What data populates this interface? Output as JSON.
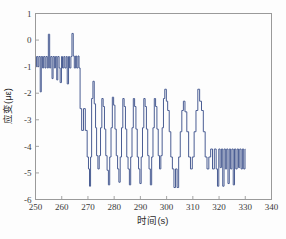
{
  "figure": {
    "name": "strain-vs-time-plot",
    "background": "#fdfdfd",
    "caption_faint": ""
  },
  "chart_data": {
    "type": "line",
    "title": "",
    "xlabel": "时间(s)",
    "ylabel": "应变(με)",
    "xlim": [
      250,
      340
    ],
    "ylim": [
      -6,
      1
    ],
    "xticks": [
      250,
      260,
      270,
      280,
      290,
      300,
      310,
      320,
      330,
      340
    ],
    "xtick_labels": [
      "250",
      "260",
      "270",
      "280",
      "290",
      "300",
      "310",
      "320",
      "330",
      "340"
    ],
    "yticks": [
      1,
      0,
      -1,
      -2,
      -3,
      -4,
      -5,
      -6
    ],
    "ytick_labels": [
      "1",
      "0",
      "-1",
      "-2",
      "-3",
      "-4",
      "-5",
      "-6"
    ],
    "grid": false,
    "legend": null,
    "series": [
      {
        "name": "strain",
        "color": "#4a5d93",
        "linewidth": 1.0,
        "description": "Noisy square-wave strain signal: initial band near -0.8, step down, train of rectangular pulses between -2.2 and -4.6, final band near -4.4",
        "x": [
          250.0,
          250.4,
          250.4,
          250.9,
          250.9,
          251.3,
          251.3,
          251.8,
          251.8,
          252.2,
          252.2,
          252.7,
          252.7,
          253.1,
          253.1,
          253.6,
          253.6,
          254.0,
          254.0,
          254.5,
          254.5,
          254.9,
          254.9,
          255.4,
          255.4,
          255.8,
          255.8,
          256.3,
          256.3,
          256.7,
          256.7,
          257.2,
          257.2,
          257.6,
          257.6,
          258.1,
          258.1,
          258.5,
          258.5,
          259.0,
          259.0,
          259.4,
          259.4,
          259.9,
          259.9,
          260.3,
          260.3,
          260.8,
          260.8,
          261.2,
          261.2,
          261.7,
          261.7,
          262.1,
          262.1,
          262.6,
          262.6,
          263.0,
          263.0,
          263.5,
          263.5,
          263.9,
          263.9,
          264.4,
          264.4,
          264.8,
          264.8,
          265.3,
          265.3,
          265.7,
          265.7,
          266.2,
          266.2,
          266.6,
          266.6,
          267.0,
          267.0,
          267.6,
          267.6,
          268.3,
          268.3,
          269.0,
          269.0,
          269.7,
          269.7,
          270.2,
          270.2,
          270.6,
          270.6,
          271.0,
          271.0,
          271.4,
          271.4,
          271.9,
          271.9,
          272.4,
          272.4,
          272.9,
          272.9,
          273.3,
          273.3,
          273.8,
          273.8,
          274.3,
          274.3,
          274.8,
          274.8,
          275.3,
          275.3,
          275.8,
          275.8,
          276.3,
          276.3,
          276.8,
          276.8,
          277.3,
          277.3,
          277.8,
          277.8,
          278.3,
          278.3,
          278.8,
          278.8,
          279.3,
          279.3,
          279.8,
          279.8,
          280.3,
          280.3,
          280.8,
          280.8,
          281.3,
          281.3,
          281.8,
          281.8,
          282.3,
          282.3,
          282.8,
          282.8,
          283.3,
          283.3,
          283.8,
          283.8,
          284.3,
          284.3,
          284.8,
          284.8,
          285.3,
          285.3,
          285.8,
          285.8,
          286.3,
          286.3,
          286.8,
          286.8,
          287.3,
          287.3,
          287.8,
          287.8,
          288.3,
          288.3,
          288.8,
          288.8,
          289.3,
          289.3,
          289.8,
          289.8,
          290.3,
          290.3,
          290.8,
          290.8,
          291.3,
          291.3,
          291.8,
          291.8,
          292.3,
          292.3,
          292.8,
          292.8,
          293.3,
          293.3,
          293.8,
          293.8,
          294.3,
          294.3,
          294.8,
          294.8,
          295.3,
          295.3,
          295.8,
          295.8,
          296.3,
          296.3,
          296.8,
          296.8,
          297.3,
          297.3,
          297.8,
          297.8,
          298.3,
          298.3,
          298.8,
          298.8,
          299.3,
          299.3,
          299.9,
          299.9,
          300.4,
          300.4,
          301.0,
          301.0,
          301.6,
          301.6,
          302.2,
          302.2,
          302.8,
          302.8,
          303.4,
          303.4,
          304.0,
          304.0,
          304.6,
          304.6,
          305.2,
          305.2,
          305.8,
          305.8,
          306.4,
          306.4,
          307.0,
          307.0,
          307.7,
          307.7,
          308.4,
          308.4,
          309.1,
          309.1,
          309.8,
          309.8,
          310.5,
          310.5,
          311.2,
          311.2,
          311.9,
          311.9,
          312.6,
          312.6,
          313.3,
          313.3,
          314.0,
          314.0,
          314.7,
          314.7,
          315.4,
          315.4,
          316.1,
          316.1,
          316.8,
          316.8,
          317.5,
          317.5,
          318.2,
          318.2,
          318.9,
          318.9,
          319.4,
          319.4,
          319.9,
          319.9,
          320.4,
          320.4,
          320.9,
          320.9,
          321.4,
          321.4,
          321.9,
          321.9,
          322.4,
          322.4,
          322.9,
          322.9,
          323.4,
          323.4,
          323.9,
          323.9,
          324.4,
          324.4,
          324.9,
          324.9,
          325.4,
          325.4,
          325.9,
          325.9,
          326.4,
          326.4,
          326.9,
          326.9,
          327.4,
          327.4,
          327.9,
          327.9,
          328.4,
          328.4,
          328.9,
          328.9,
          329.4,
          329.4,
          329.9,
          329.9,
          330.0
        ],
        "y": [
          -1.0,
          -1.0,
          -0.62,
          -0.62,
          -1.0,
          -1.0,
          -0.62,
          -0.62,
          -1.95,
          -1.95,
          -0.62,
          -0.62,
          -1.05,
          -1.05,
          -0.62,
          -0.62,
          -1.05,
          -1.05,
          -0.62,
          -0.62,
          -1.05,
          -1.05,
          0.22,
          0.22,
          -1.05,
          -1.05,
          -0.62,
          -0.62,
          -1.45,
          -1.45,
          -0.62,
          -0.62,
          -1.05,
          -1.05,
          -0.62,
          -0.62,
          -1.5,
          -1.5,
          -0.62,
          -0.62,
          -1.05,
          -1.05,
          -1.6,
          -1.6,
          -0.62,
          -0.62,
          -1.05,
          -1.05,
          -0.62,
          -0.62,
          -1.05,
          -1.05,
          -0.62,
          -0.62,
          -1.65,
          -1.65,
          -0.62,
          -0.62,
          -1.05,
          -1.05,
          -0.62,
          -0.62,
          0.25,
          0.25,
          -0.6,
          -0.6,
          -1.05,
          -1.05,
          -0.6,
          -0.6,
          -1.05,
          -1.05,
          -0.6,
          -0.6,
          -1.05,
          -1.05,
          -2.58,
          -2.58,
          -3.4,
          -3.4,
          -2.58,
          -2.58,
          -3.4,
          -3.4,
          -4.4,
          -4.4,
          -4.85,
          -4.85,
          -5.5,
          -5.5,
          -4.4,
          -4.4,
          -2.2,
          -2.2,
          -1.55,
          -1.55,
          -2.4,
          -2.4,
          -3.3,
          -3.3,
          -4.35,
          -4.35,
          -4.85,
          -4.85,
          -4.35,
          -4.35,
          -3.3,
          -3.3,
          -2.2,
          -2.2,
          -2.5,
          -2.5,
          -3.35,
          -3.35,
          -4.35,
          -4.35,
          -4.9,
          -4.9,
          -5.45,
          -5.45,
          -4.4,
          -4.4,
          -3.3,
          -3.3,
          -2.15,
          -2.15,
          -2.45,
          -2.45,
          -3.35,
          -3.35,
          -4.35,
          -4.35,
          -4.85,
          -4.85,
          -5.35,
          -5.35,
          -4.4,
          -4.4,
          -3.3,
          -3.3,
          -2.2,
          -2.2,
          -2.5,
          -2.5,
          -3.35,
          -3.35,
          -4.4,
          -4.4,
          -4.85,
          -4.85,
          -5.45,
          -5.45,
          -4.4,
          -4.4,
          -3.3,
          -3.3,
          -2.2,
          -2.2,
          -2.5,
          -2.5,
          -3.35,
          -3.35,
          -4.4,
          -4.4,
          -4.85,
          -4.85,
          -5.4,
          -5.4,
          -4.4,
          -4.4,
          -3.3,
          -3.3,
          -2.2,
          -2.2,
          -2.5,
          -2.5,
          -3.35,
          -3.35,
          -4.35,
          -4.35,
          -4.85,
          -4.85,
          -5.45,
          -5.45,
          -4.4,
          -4.4,
          -3.3,
          -3.3,
          -2.2,
          -2.2,
          -2.5,
          -2.5,
          -3.35,
          -3.35,
          -4.35,
          -4.35,
          -4.85,
          -4.85,
          -4.35,
          -4.35,
          -3.3,
          -3.3,
          -2.2,
          -2.2,
          -1.85,
          -1.85,
          -2.3,
          -2.3,
          -2.65,
          -2.65,
          -3.45,
          -3.45,
          -4.4,
          -4.4,
          -4.85,
          -4.85,
          -5.55,
          -5.55,
          -4.85,
          -4.85,
          -5.55,
          -5.55,
          -4.4,
          -4.4,
          -3.45,
          -3.45,
          -2.65,
          -2.65,
          -2.3,
          -2.3,
          -2.7,
          -2.7,
          -3.45,
          -3.45,
          -4.4,
          -4.4,
          -4.85,
          -4.85,
          -4.4,
          -4.4,
          -3.45,
          -3.45,
          -2.65,
          -2.65,
          -1.85,
          -1.85,
          -2.3,
          -2.3,
          -2.65,
          -2.65,
          -3.45,
          -3.45,
          -4.4,
          -4.4,
          -4.85,
          -4.85,
          -4.4,
          -4.4,
          -4.1,
          -4.1,
          -4.85,
          -4.85,
          -4.1,
          -4.1,
          -4.85,
          -4.85,
          -5.5,
          -5.5,
          -4.1,
          -4.1,
          -4.8,
          -4.8,
          -4.1,
          -4.1,
          -5.5,
          -5.5,
          -4.1,
          -4.1,
          -4.85,
          -4.85,
          -4.1,
          -4.1,
          -5.4,
          -5.4,
          -4.1,
          -4.1,
          -4.85,
          -4.85,
          -4.1,
          -4.1,
          -5.45,
          -5.45,
          -4.1,
          -4.1,
          -4.85,
          -4.85,
          -4.1,
          -4.1,
          -4.8,
          -4.8,
          -4.1,
          -4.1,
          -4.85,
          -4.85,
          -4.1,
          -4.1,
          -4.85,
          -4.85,
          -4.1,
          -4.1
        ]
      }
    ]
  }
}
